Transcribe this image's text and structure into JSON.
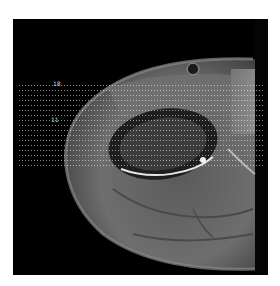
{
  "image": {
    "kind": "axial MRI scan of hip region",
    "background_color": "#ffffff",
    "frame_color": "#000000",
    "tissue_color": "#6b6b6b",
    "bright_tissue_color": "#9a9a9a"
  },
  "overlay": {
    "dotted_band": true,
    "labels": [
      {
        "id": "marker-1",
        "text": "18"
      },
      {
        "id": "marker-2",
        "text": "11"
      }
    ]
  }
}
